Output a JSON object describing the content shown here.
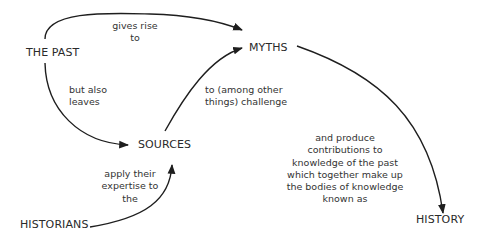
{
  "nodes": {
    "the_past": "THE PAST",
    "myths": "MYTHS",
    "sources": "SOURCES",
    "historians": "HISTORIANS",
    "history": "HISTORY"
  },
  "edges": {
    "past_to_myths": {
      "from": "THE PAST",
      "to": "MYTHS",
      "label_lines": [
        "gives rise",
        "to"
      ]
    },
    "past_to_sources": {
      "from": "THE PAST",
      "to": "SOURCES",
      "label_lines": [
        "but also",
        "leaves"
      ]
    },
    "sources_to_myths": {
      "from": "SOURCES",
      "to": "MYTHS",
      "label_lines": [
        "to (among other",
        "things) challenge"
      ]
    },
    "historians_to_sources": {
      "from": "HISTORIANS",
      "to": "SOURCES",
      "label_lines": [
        "apply their",
        "expertise to",
        "the"
      ]
    },
    "myths_to_history": {
      "from": "MYTHS",
      "to": "HISTORY",
      "label_lines": [
        "and produce",
        "contributions to",
        "knowledge of the past",
        "which together make up",
        "the bodies of knowledge",
        "known as"
      ]
    }
  },
  "colors": {
    "line": "#1e1e1e",
    "text": "#2b2b2b",
    "background": "#ffffff"
  }
}
